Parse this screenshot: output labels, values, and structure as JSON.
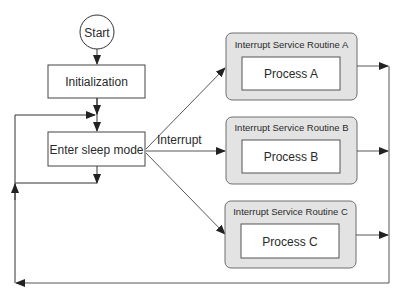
{
  "diagram": {
    "start": {
      "label": "Start"
    },
    "init": {
      "label": "Initialization"
    },
    "sleep": {
      "label": "Enter sleep mode"
    },
    "interrupt_label": "Interrupt",
    "isrs": [
      {
        "title": "Interrupt Service Routine A",
        "process": "Process A"
      },
      {
        "title": "Interrupt Service Routine B",
        "process": "Process B"
      },
      {
        "title": "Interrupt Service Routine C",
        "process": "Process C"
      }
    ],
    "colors": {
      "stroke": "#333333",
      "isr_fill": "#e3e3e3",
      "isr_stroke": "#6e6e6e",
      "box_fill": "#ffffff"
    }
  }
}
